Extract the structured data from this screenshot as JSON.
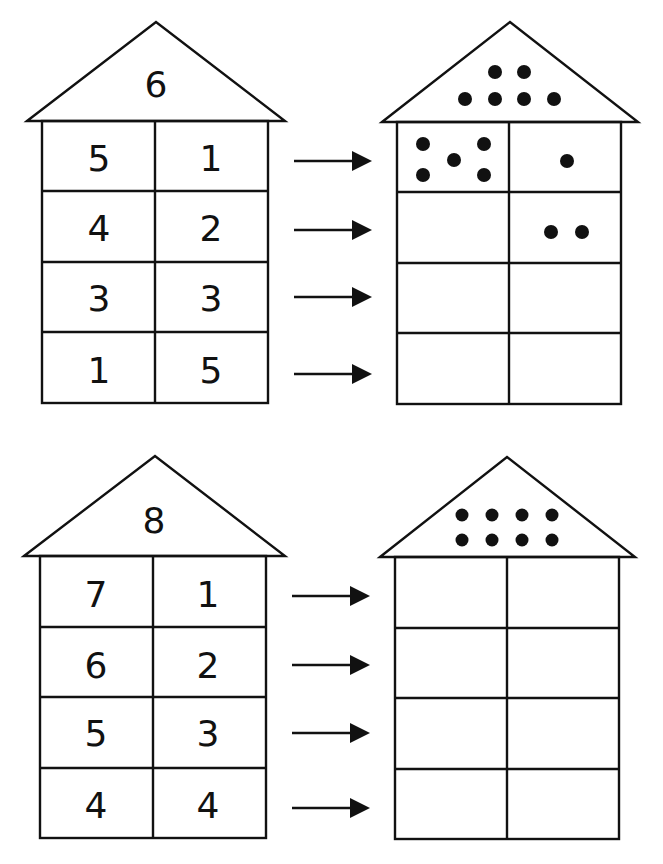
{
  "worksheet": {
    "exercises": [
      {
        "id": "six",
        "roof_number": "6",
        "rows": [
          {
            "left": "5",
            "right": "1"
          },
          {
            "left": "4",
            "right": "2"
          },
          {
            "left": "3",
            "right": "3"
          },
          {
            "left": "1",
            "right": "5"
          }
        ],
        "dot_house": {
          "roof_dots": 6,
          "rows": [
            {
              "left_dots": 5,
              "right_dots": 1
            },
            {
              "left_dots": 0,
              "right_dots": 2
            },
            {
              "left_dots": 0,
              "right_dots": 0
            },
            {
              "left_dots": 0,
              "right_dots": 0
            }
          ]
        }
      },
      {
        "id": "eight",
        "roof_number": "8",
        "rows": [
          {
            "left": "7",
            "right": "1"
          },
          {
            "left": "6",
            "right": "2"
          },
          {
            "left": "5",
            "right": "3"
          },
          {
            "left": "4",
            "right": "4"
          }
        ],
        "dot_house": {
          "roof_dots": 8,
          "rows": [
            {
              "left_dots": 0,
              "right_dots": 0
            },
            {
              "left_dots": 0,
              "right_dots": 0
            },
            {
              "left_dots": 0,
              "right_dots": 0
            },
            {
              "left_dots": 0,
              "right_dots": 0
            }
          ]
        }
      }
    ],
    "arrow_icon": "right-arrow-icon"
  }
}
